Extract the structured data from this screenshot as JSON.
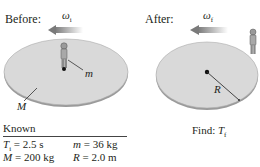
{
  "before": {
    "title": "Before:",
    "omega_symbol": "ω",
    "omega_subscript": "i",
    "person_label": "m",
    "disk_label": "M"
  },
  "after": {
    "title": "After:",
    "omega_symbol": "ω",
    "omega_subscript": "f",
    "radius_label": "R"
  },
  "known": {
    "title": "Known",
    "items": [
      {
        "symbol": "T",
        "subscript": "i",
        "value": " = 2.5 s"
      },
      {
        "symbol": "m",
        "subscript": "",
        "value": " = 36 kg"
      },
      {
        "symbol": "M",
        "subscript": "",
        "value": " = 200 kg"
      },
      {
        "symbol": "R",
        "subscript": "",
        "value": " = 2.0 m"
      }
    ]
  },
  "find": {
    "label": "Find: ",
    "symbol": "T",
    "subscript": "f"
  },
  "colors": {
    "disk_fill": "#d9d9d9",
    "disk_edge": "#9a9a9a",
    "arrow": "#8a8a8a"
  }
}
